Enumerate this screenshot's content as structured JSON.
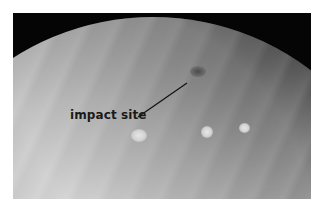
{
  "image": {
    "subject": "Jupiter",
    "description": "Grayscale photograph of Jupiter's limb against black space showing cloud bands and a dark impact scar",
    "colors": {
      "background": "#ffffff",
      "space": "#050505",
      "planet_light": "#d8d8d8",
      "spot": "#4a4a4a",
      "label": "#1a1a1a"
    }
  },
  "annotation": {
    "label": "impact site",
    "pointer_from": [
      138,
      117
    ],
    "pointer_to": [
      187,
      83
    ],
    "target_feature": "dark-spot"
  },
  "features": {
    "dark_spot": {
      "cx": 198,
      "cy": 72
    },
    "white_ovals": [
      {
        "cx": 139,
        "cy": 136
      },
      {
        "cx": 207,
        "cy": 132
      },
      {
        "cx": 244,
        "cy": 128
      }
    ]
  }
}
